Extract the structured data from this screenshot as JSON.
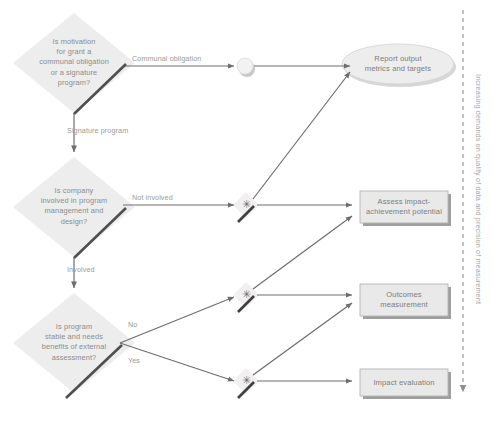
{
  "diagram": {
    "colors": {
      "node_fill": "#ededed",
      "node_fill_alt": "#e6e6e6",
      "box_fill": "#e9e9e9",
      "box_border": "#b4b4b4",
      "arrow": "#6e6e6e",
      "thick_arrow": "#4f4f4f",
      "text": "#8c8c8c",
      "axis": "#8f8f8f",
      "shadow": "#cfcfcf"
    },
    "decisions": [
      {
        "id": "decision-motivation",
        "text": "Is motivation\nfor grant a\ncommunal obligation\nor a signature\nprogram?"
      },
      {
        "id": "decision-company-involvement",
        "text": "Is company\ninvolved in program\nmanagement and\ndesign?"
      },
      {
        "id": "decision-program-stability",
        "text": "Is program\nstable and needs\nbenefits of external\nassessment?"
      }
    ],
    "outcomes": [
      {
        "id": "outcome-report-output",
        "shape": "ellipse",
        "text": "Report output\nmetrics and targets"
      },
      {
        "id": "outcome-assess-impact",
        "shape": "rect",
        "text": "Assess impact-\nachievement potential"
      },
      {
        "id": "outcome-outcomes-measurement",
        "shape": "rect",
        "text": "Outcomes\nmeasurement"
      },
      {
        "id": "outcome-impact-evaluation",
        "shape": "rect",
        "text": "Impact evaluation"
      }
    ],
    "edge_labels": [
      {
        "id": "edge-label-communal-obligation",
        "text": "Communal obligation"
      },
      {
        "id": "edge-label-signature-program",
        "text": "Signature program"
      },
      {
        "id": "edge-label-not-involved",
        "text": "Not involved"
      },
      {
        "id": "edge-label-involved",
        "text": "Involved"
      },
      {
        "id": "edge-label-no",
        "text": "No"
      },
      {
        "id": "edge-label-yes",
        "text": "Yes"
      }
    ],
    "connectors": [
      {
        "id": "connector-circle",
        "glyph": ""
      },
      {
        "id": "connector-star-1",
        "glyph": "✳"
      },
      {
        "id": "connector-star-2",
        "glyph": "✳"
      },
      {
        "id": "connector-star-3",
        "glyph": "✳"
      }
    ],
    "axis": {
      "id": "increasing-demands-axis",
      "label": "Increasing demands on quality of data and precision of measurement",
      "direction": "down"
    }
  }
}
